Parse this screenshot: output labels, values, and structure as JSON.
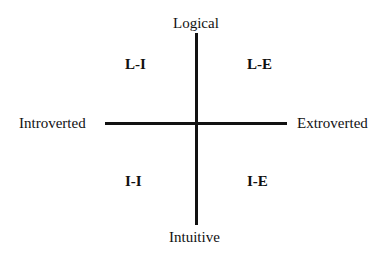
{
  "diagram": {
    "type": "quadrant",
    "axes": {
      "vertical": {
        "top_label": "Logical",
        "bottom_label": "Intuitive"
      },
      "horizontal": {
        "left_label": "Introverted",
        "right_label": "Extroverted"
      }
    },
    "quadrants": {
      "top_left": "L-I",
      "top_right": "L-E",
      "bottom_left": "I-I",
      "bottom_right": "I-E"
    },
    "colors": {
      "line": "#111111",
      "text": "#111111",
      "background": "#ffffff"
    }
  }
}
